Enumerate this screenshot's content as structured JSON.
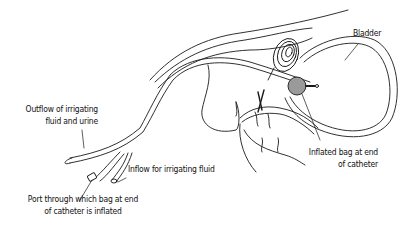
{
  "diagram": {
    "labels": {
      "bladder": "Bladder",
      "outflow": [
        "Outflow of irrigating",
        "fluid and urine"
      ],
      "inflow": "Inflow for irrigating fluid",
      "port": [
        "Port through which bag at end",
        "of catheter is inflated"
      ],
      "balloon": [
        "Inflated bag at end",
        "of catheter"
      ]
    },
    "colors": {
      "line": "#1a1a1a",
      "balloon_fill": "#9a9a9a",
      "background": "#ffffff"
    }
  }
}
